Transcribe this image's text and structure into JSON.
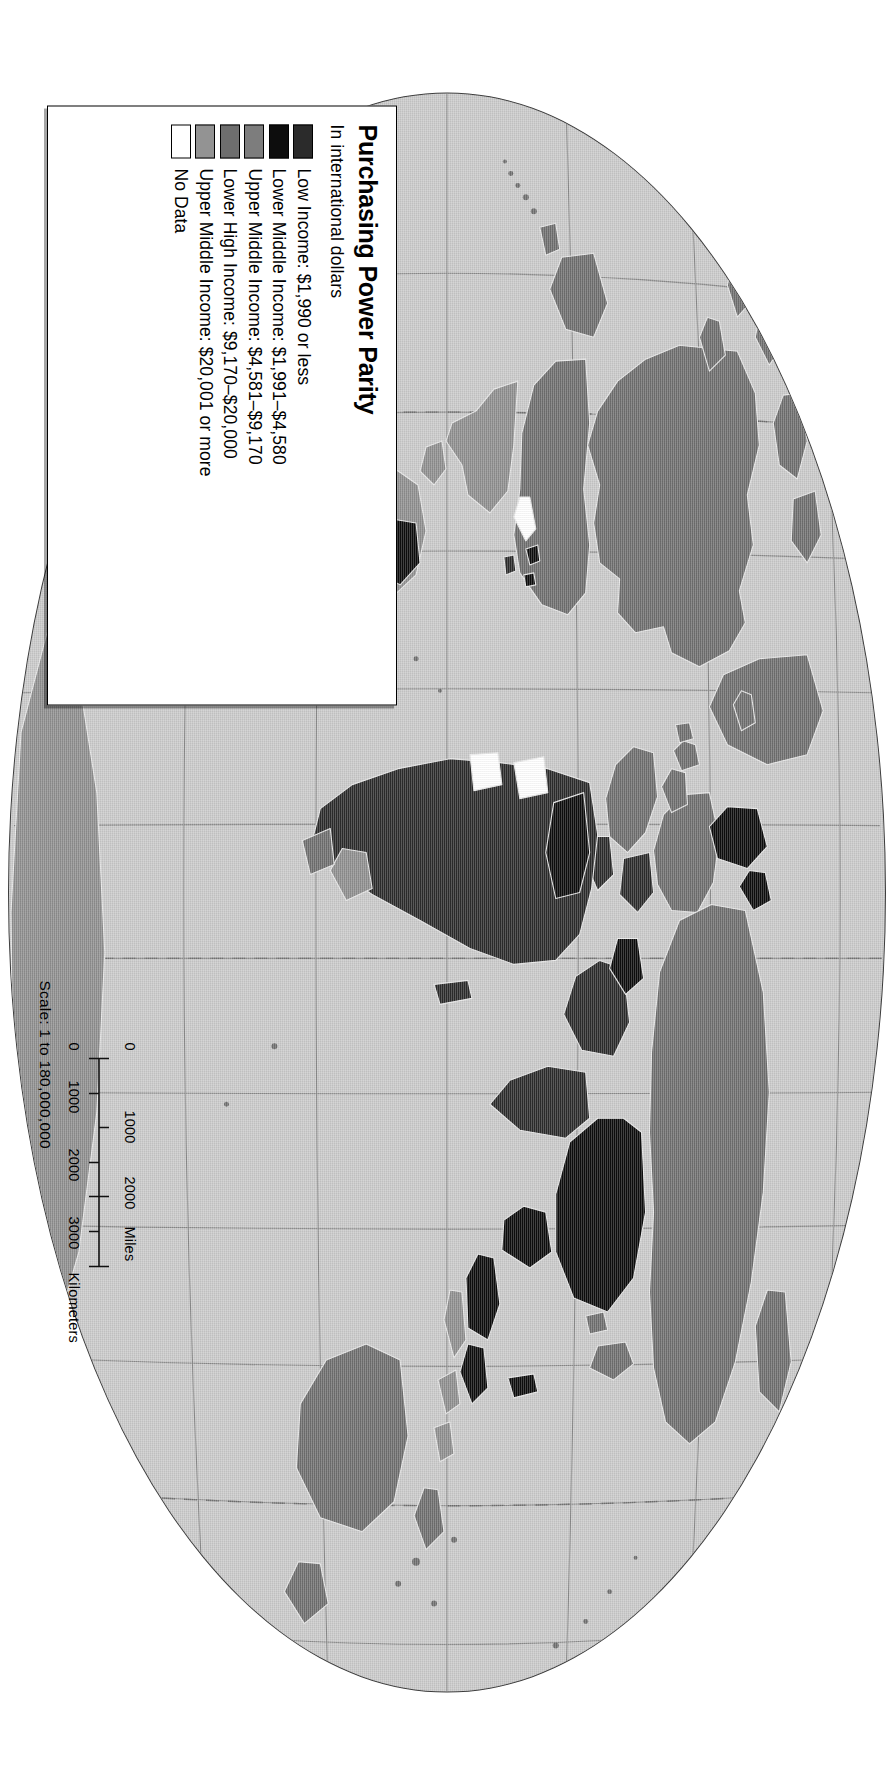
{
  "document": {
    "type": "thematic-world-map",
    "orientation": "rotated-90-clockwise",
    "projection": "robinson-elliptical"
  },
  "legend": {
    "title": "Purchasing Power Parity",
    "subtitle": "In international dollars",
    "items": [
      {
        "label": "Low Income: $1,990 or less",
        "color": "#2b2b2b"
      },
      {
        "label": "Lower Middle Income: $1,991–$4,580",
        "color": "#0d0d0d"
      },
      {
        "label": "Upper Middle Income: $4,581–$9,170",
        "color": "#7d7d7d"
      },
      {
        "label": "Lower High Income: $9,170–$20,000",
        "color": "#6e6e6e"
      },
      {
        "label": "Upper Middle Income: $20,001 or more",
        "color": "#939393"
      },
      {
        "label": "No Data",
        "color": "#ffffff"
      }
    ]
  },
  "scale": {
    "text": "Scale:  1 to 180,000,000",
    "miles": {
      "unit": "Miles",
      "ticks": [
        "0",
        "1000",
        "2000"
      ]
    },
    "kilometers": {
      "unit": "Kilometers",
      "ticks": [
        "0",
        "1000",
        "2000",
        "3000"
      ]
    }
  },
  "colors": {
    "ocean": "#c9c9c9",
    "graticule": "#7a7a7a",
    "outline": "#3d3d3d",
    "page": "#ffffff"
  }
}
